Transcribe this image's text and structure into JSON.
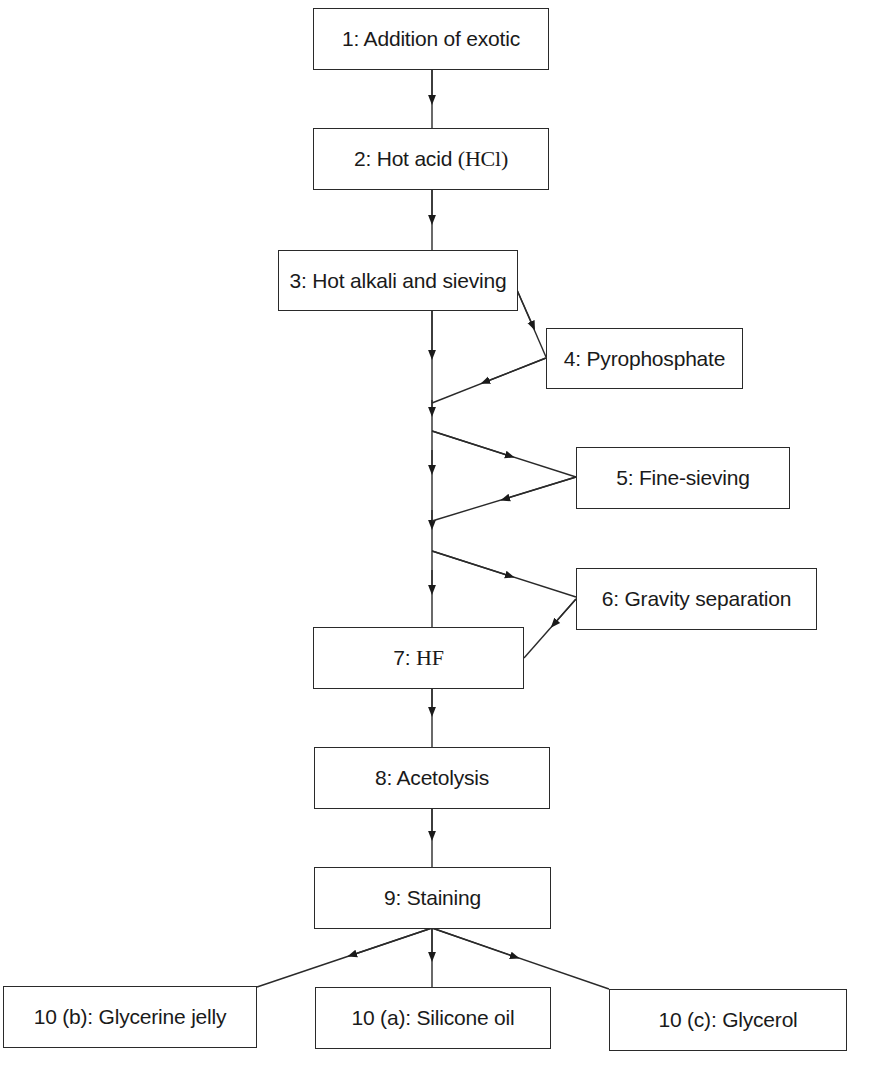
{
  "diagram": {
    "type": "flowchart",
    "nodes": [
      {
        "id": "1",
        "label": "1: Addition of exotic"
      },
      {
        "id": "2",
        "label_prefix": "2: Hot acid ",
        "label_chem": "(HCl)"
      },
      {
        "id": "3",
        "label": "3: Hot alkali and sieving"
      },
      {
        "id": "4",
        "label": "4: Pyrophosphate"
      },
      {
        "id": "5",
        "label": "5: Fine-sieving"
      },
      {
        "id": "6",
        "label": "6: Gravity separation"
      },
      {
        "id": "7",
        "label_prefix": "7: ",
        "label_chem": "HF"
      },
      {
        "id": "8",
        "label": "8: Acetolysis"
      },
      {
        "id": "9",
        "label": "9: Staining"
      },
      {
        "id": "10b",
        "label": "10 (b): Glycerine jelly"
      },
      {
        "id": "10a",
        "label": "10 (a): Silicone oil"
      },
      {
        "id": "10c",
        "label": "10 (c): Glycerol"
      }
    ],
    "edges": [
      [
        "1",
        "2"
      ],
      [
        "2",
        "3"
      ],
      [
        "3",
        "main-line"
      ],
      [
        "3",
        "4"
      ],
      [
        "4",
        "main-line"
      ],
      [
        "main-line",
        "5"
      ],
      [
        "5",
        "main-line"
      ],
      [
        "main-line",
        "6"
      ],
      [
        "6",
        "7"
      ],
      [
        "main-line",
        "7"
      ],
      [
        "7",
        "8"
      ],
      [
        "8",
        "9"
      ],
      [
        "9",
        "10b"
      ],
      [
        "9",
        "10a"
      ],
      [
        "9",
        "10c"
      ]
    ]
  }
}
